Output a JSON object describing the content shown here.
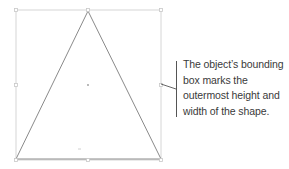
{
  "diagram": {
    "shape": "triangle",
    "colors": {
      "bounding_box": "#d6d6d6",
      "triangle_stroke": "#8a8a8a",
      "handle": "#c8c8c8",
      "callout_line": "#555555",
      "text": "#3a3a3a"
    }
  },
  "callout": {
    "lines": [
      "The object’s bounding",
      "box marks the",
      "outermost height and",
      "width of the shape."
    ]
  }
}
